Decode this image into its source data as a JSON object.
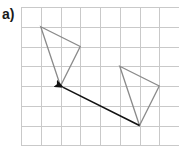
{
  "label": "a)",
  "grid": {
    "origin_px": [
      21,
      7
    ],
    "cell_px": 19.75,
    "cols": 8,
    "rows": 7,
    "line_color": "#c9c9c9"
  },
  "shapes": {
    "object_triangle": {
      "vertices_grid": [
        [
          5,
          3
        ],
        [
          7,
          4
        ],
        [
          6,
          6
        ]
      ],
      "stroke": "#8a8a8a"
    },
    "image_triangle": {
      "vertices_grid": [
        [
          1,
          1
        ],
        [
          3,
          2
        ],
        [
          2,
          4
        ]
      ],
      "stroke": "#8a8a8a"
    },
    "translation_arrow": {
      "from_grid": [
        6,
        6
      ],
      "to_grid": [
        2,
        4
      ],
      "vector": [
        -4,
        -2
      ],
      "stroke": "#111111"
    }
  }
}
